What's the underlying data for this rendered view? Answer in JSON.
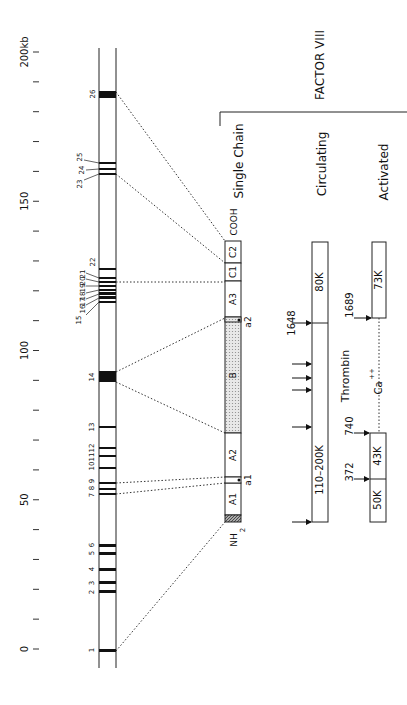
{
  "title": "FACTOR VIII",
  "axis": {
    "unit_label": "200kb",
    "ticks": [
      {
        "kb": 0,
        "label": "0"
      },
      {
        "kb": 50,
        "label": "50"
      },
      {
        "kb": 100,
        "label": "100"
      },
      {
        "kb": 150,
        "label": "150"
      },
      {
        "kb": 200,
        "label": "200kb"
      }
    ]
  },
  "gene": {
    "exons": [
      {
        "n": "1",
        "y": 649,
        "h": 3
      },
      {
        "n": "2",
        "y": 590,
        "h": 3
      },
      {
        "n": "3",
        "y": 581,
        "h": 3
      },
      {
        "n": "4",
        "y": 568,
        "h": 3
      },
      {
        "n": "5",
        "y": 552,
        "h": 3
      },
      {
        "n": "6",
        "y": 544,
        "h": 3
      },
      {
        "n": "7",
        "y": 493,
        "h": 2
      },
      {
        "n": "8",
        "y": 488,
        "h": 2
      },
      {
        "n": "9",
        "y": 482,
        "h": 2
      },
      {
        "n": "10",
        "y": 467,
        "h": 2
      },
      {
        "n": "11",
        "y": 455,
        "h": 2
      },
      {
        "n": "12",
        "y": 447,
        "h": 2
      },
      {
        "n": "13",
        "y": 426,
        "h": 2
      },
      {
        "n": "14",
        "y": 371,
        "h": 11
      },
      {
        "n": "15",
        "y": 301,
        "h": 2
      },
      {
        "n": "16",
        "y": 296,
        "h": 3
      },
      {
        "n": "17",
        "y": 292,
        "h": 3
      },
      {
        "n": "18",
        "y": 289,
        "h": 2
      },
      {
        "n": "19",
        "y": 285,
        "h": 2
      },
      {
        "n": "20",
        "y": 281,
        "h": 2
      },
      {
        "n": "21",
        "y": 277,
        "h": 2
      },
      {
        "n": "22",
        "y": 268,
        "h": 2
      },
      {
        "n": "23",
        "y": 173,
        "h": 2
      },
      {
        "n": "24",
        "y": 168,
        "h": 2
      },
      {
        "n": "25",
        "y": 162,
        "h": 2
      },
      {
        "n": "26",
        "y": 91,
        "h": 7
      }
    ]
  },
  "sections": {
    "single_chain": "Single Chain",
    "circulating": "Circulating",
    "activated": "Activated"
  },
  "single_chain": {
    "domains": [
      {
        "name": "C2",
        "top": 241,
        "bottom": 263
      },
      {
        "name": "C1",
        "top": 263,
        "bottom": 281
      },
      {
        "name": "A3",
        "top": 281,
        "bottom": 317
      },
      {
        "name": "B",
        "top": 318,
        "bottom": 433
      },
      {
        "name": "A2",
        "top": 433,
        "bottom": 477
      },
      {
        "name": "A1",
        "top": 483,
        "bottom": 515
      }
    ],
    "cooh_label": "COOH",
    "nh2_label": "NH",
    "nh2_sub": "2",
    "a1_label": "a1",
    "a2_label": "a2"
  },
  "circulating": {
    "heavy_label": "110–200K",
    "light_label": "80K",
    "cleavage_site": "1648",
    "thrombin_label": "Thrombin"
  },
  "activated": {
    "chains": [
      {
        "label": "73K",
        "site": "1689"
      },
      {
        "label": "43K",
        "site": "740"
      },
      {
        "label": "50K",
        "site": "372"
      }
    ],
    "ca_label": "Ca",
    "ca_sup": "++"
  }
}
